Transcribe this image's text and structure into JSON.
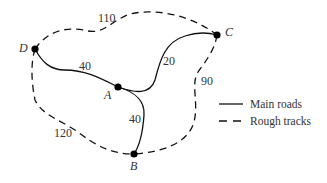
{
  "diagram": {
    "nodes": [
      {
        "id": "A",
        "label": "A",
        "x": 118,
        "y": 87
      },
      {
        "id": "B",
        "label": "B",
        "x": 134,
        "y": 154
      },
      {
        "id": "C",
        "label": "C",
        "x": 217,
        "y": 35
      },
      {
        "id": "D",
        "label": "D",
        "x": 35,
        "y": 49
      }
    ],
    "edges": [
      {
        "from": "D",
        "to": "A",
        "type": "main",
        "weight": "40"
      },
      {
        "from": "A",
        "to": "C",
        "type": "main",
        "weight": "20"
      },
      {
        "from": "A",
        "to": "B",
        "type": "main",
        "weight": "40"
      },
      {
        "from": "D",
        "to": "C",
        "type": "rough",
        "weight": "110"
      },
      {
        "from": "C",
        "to": "B",
        "type": "rough",
        "weight": "90"
      },
      {
        "from": "D",
        "to": "B",
        "type": "rough",
        "weight": "120"
      }
    ],
    "legend": [
      {
        "style": "solid",
        "label": "Main roads"
      },
      {
        "style": "dashed",
        "label": "Rough tracks"
      }
    ],
    "colors": {
      "line": "#111111",
      "text": "#333333",
      "node": "#000000"
    }
  }
}
